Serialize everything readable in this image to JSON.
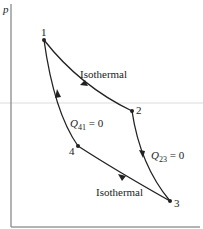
{
  "diagram": {
    "type": "p-V cycle diagram",
    "axes": {
      "y_label": "p"
    },
    "points": [
      {
        "id": "1",
        "label": "1"
      },
      {
        "id": "2",
        "label": "2"
      },
      {
        "id": "3",
        "label": "3"
      },
      {
        "id": "4",
        "label": "4"
      }
    ],
    "processes": [
      {
        "from": "1",
        "to": "2",
        "label": "Isothermal"
      },
      {
        "from": "2",
        "to": "3",
        "label_main": "Q",
        "label_sub": "23",
        "label_rest": " = 0"
      },
      {
        "from": "3",
        "to": "4",
        "label": "Isothermal"
      },
      {
        "from": "4",
        "to": "1",
        "label_main": "Q",
        "label_sub": "41",
        "label_rest": " = 0"
      }
    ],
    "colors": {
      "curve": "#222222",
      "axis": "#777777",
      "guide": "#d8d8d8"
    }
  }
}
